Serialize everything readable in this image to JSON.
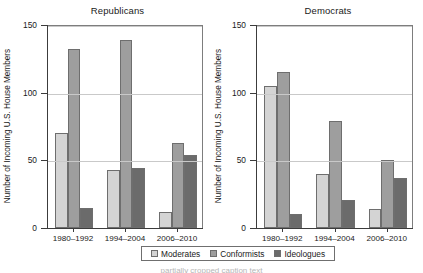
{
  "figure": {
    "background": "#ffffff",
    "axis_color": "#3c3c3c",
    "grid_color": "#c9c9c9"
  },
  "ylabel": "Number of Incoming U.S. House Members",
  "legend": {
    "items": [
      {
        "label": "Moderates",
        "color": "#d4d4d4"
      },
      {
        "label": "Conformists",
        "color": "#9e9e9e"
      },
      {
        "label": "Ideologues",
        "color": "#6b6b6b"
      }
    ]
  },
  "caption_ghost": "partially cropped caption text",
  "chart_data": [
    {
      "type": "bar",
      "title": "Republicans",
      "xlabel": "",
      "ylabel": "Number of Incoming U.S. House Members",
      "categories": [
        "1980–1992",
        "1994–2004",
        "2006–2010"
      ],
      "series": [
        {
          "name": "Moderates",
          "color": "#d4d4d4",
          "values": [
            70,
            43,
            12
          ]
        },
        {
          "name": "Conformists",
          "color": "#9e9e9e",
          "values": [
            132,
            139,
            63
          ]
        },
        {
          "name": "Ideologues",
          "color": "#6b6b6b",
          "values": [
            15,
            44,
            54
          ]
        }
      ],
      "ylim": [
        0,
        150
      ],
      "yticks": [
        0,
        50,
        100,
        150
      ],
      "grid": true,
      "legend_position": "bottom-center"
    },
    {
      "type": "bar",
      "title": "Democrats",
      "xlabel": "",
      "ylabel": "Number of Incoming U.S. House Members",
      "categories": [
        "1980–1992",
        "1994–2004",
        "2006–2010"
      ],
      "series": [
        {
          "name": "Moderates",
          "color": "#d4d4d4",
          "values": [
            105,
            40,
            14
          ]
        },
        {
          "name": "Conformists",
          "color": "#9e9e9e",
          "values": [
            115,
            79,
            50
          ]
        },
        {
          "name": "Ideologues",
          "color": "#6b6b6b",
          "values": [
            10,
            21,
            37
          ]
        }
      ],
      "ylim": [
        0,
        150
      ],
      "yticks": [
        0,
        50,
        100,
        150
      ],
      "grid": true,
      "legend_position": "bottom-center"
    }
  ]
}
